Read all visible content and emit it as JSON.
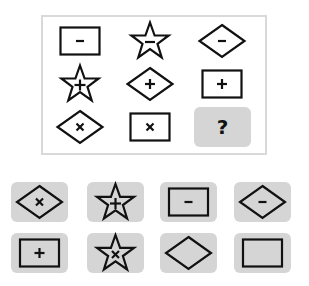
{
  "puzzle": {
    "frame_border_color": "#d9d9d9",
    "tile_fill_color": "#d5d5d5",
    "stroke_color": "#111111",
    "grid": [
      {
        "row": 1,
        "col": 1,
        "shape": "rectangle",
        "symbol": "minus"
      },
      {
        "row": 1,
        "col": 2,
        "shape": "star",
        "symbol": "minus"
      },
      {
        "row": 1,
        "col": 3,
        "shape": "diamond",
        "symbol": "minus"
      },
      {
        "row": 2,
        "col": 1,
        "shape": "star",
        "symbol": "plus"
      },
      {
        "row": 2,
        "col": 2,
        "shape": "diamond",
        "symbol": "plus"
      },
      {
        "row": 2,
        "col": 3,
        "shape": "rectangle",
        "symbol": "plus"
      },
      {
        "row": 3,
        "col": 1,
        "shape": "diamond",
        "symbol": "times"
      },
      {
        "row": 3,
        "col": 2,
        "shape": "rectangle",
        "symbol": "times"
      },
      {
        "row": 3,
        "col": 3,
        "shape": "unknown",
        "symbol": "question"
      }
    ],
    "question_mark": "?"
  },
  "options": [
    {
      "index": 1,
      "shape": "diamond",
      "symbol": "times"
    },
    {
      "index": 2,
      "shape": "star",
      "symbol": "plus"
    },
    {
      "index": 3,
      "shape": "rectangle",
      "symbol": "minus"
    },
    {
      "index": 4,
      "shape": "diamond",
      "symbol": "minus"
    },
    {
      "index": 5,
      "shape": "rectangle",
      "symbol": "plus"
    },
    {
      "index": 6,
      "shape": "star",
      "symbol": "times"
    },
    {
      "index": 7,
      "shape": "diamond",
      "symbol": "none"
    },
    {
      "index": 8,
      "shape": "rectangle",
      "symbol": "none"
    }
  ]
}
